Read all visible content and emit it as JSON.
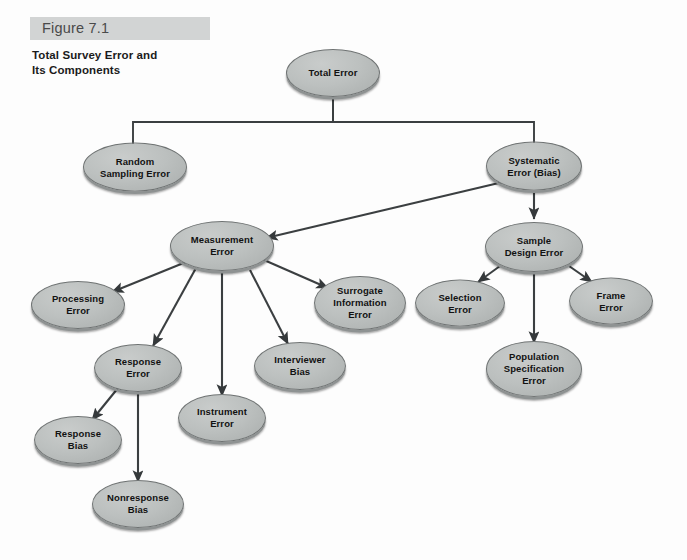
{
  "caption": {
    "figure_label": "Figure 7.1",
    "title": "Total Survey Error and\nIts Components",
    "title_line1": "Total Survey Error and",
    "title_line2": "Its Components"
  },
  "colors": {
    "page_background": "#fdfdfd",
    "band_background": "#d2d4d4",
    "node_fill": "#bcc0bf",
    "node_stroke": "#6f7373",
    "node_shadow": "#8e9292",
    "edge": "#3b3f41",
    "text": "#121212"
  },
  "chart_data": {
    "type": "diagram",
    "diagram_type": "hierarchy-tree",
    "title": "Total Survey Error and Its Components",
    "nodes": [
      {
        "id": "total-error",
        "label": "Total Error",
        "lines": [
          "Total Error"
        ],
        "x": 333,
        "y": 73,
        "w": 94,
        "h": 48
      },
      {
        "id": "random-sampling-error",
        "label": "Random Sampling Error",
        "lines": [
          "Random",
          "Sampling Error"
        ],
        "x": 135,
        "y": 167,
        "w": 104,
        "h": 49
      },
      {
        "id": "systematic-error-bias",
        "label": "Systematic Error (Bias)",
        "lines": [
          "Systematic",
          "Error (Bias)"
        ],
        "x": 534,
        "y": 166,
        "w": 96,
        "h": 49
      },
      {
        "id": "measurement-error",
        "label": "Measurement Error",
        "lines": [
          "Measurement",
          "Error"
        ],
        "x": 222,
        "y": 246,
        "w": 104,
        "h": 50
      },
      {
        "id": "sample-design-error",
        "label": "Sample Design Error",
        "lines": [
          "Sample",
          "Design Error"
        ],
        "x": 534,
        "y": 247,
        "w": 98,
        "h": 50
      },
      {
        "id": "processing-error",
        "label": "Processing Error",
        "lines": [
          "Processing",
          "Error"
        ],
        "x": 78,
        "y": 305,
        "w": 94,
        "h": 48
      },
      {
        "id": "surrogate-information-error",
        "label": "Surrogate Information Error",
        "lines": [
          "Surrogate",
          "Information",
          "Error"
        ],
        "x": 360,
        "y": 303,
        "w": 92,
        "h": 54
      },
      {
        "id": "selection-error",
        "label": "Selection Error",
        "lines": [
          "Selection",
          "Error"
        ],
        "x": 460,
        "y": 303,
        "w": 90,
        "h": 47
      },
      {
        "id": "frame-error",
        "label": "Frame Error",
        "lines": [
          "Frame",
          "Error"
        ],
        "x": 611,
        "y": 301,
        "w": 84,
        "h": 47
      },
      {
        "id": "response-error",
        "label": "Response Error",
        "lines": [
          "Response",
          "Error"
        ],
        "x": 138,
        "y": 368,
        "w": 88,
        "h": 48
      },
      {
        "id": "interviewer-bias",
        "label": "Interviewer Bias",
        "lines": [
          "Interviewer",
          "Bias"
        ],
        "x": 300,
        "y": 366,
        "w": 92,
        "h": 48
      },
      {
        "id": "population-specification-error",
        "label": "Population Specification Error",
        "lines": [
          "Population",
          "Specification",
          "Error"
        ],
        "x": 534,
        "y": 369,
        "w": 96,
        "h": 56
      },
      {
        "id": "instrument-error",
        "label": "Instrument Error",
        "lines": [
          "Instrument",
          "Error"
        ],
        "x": 222,
        "y": 418,
        "w": 88,
        "h": 48
      },
      {
        "id": "response-bias",
        "label": "Response Bias",
        "lines": [
          "Response",
          "Bias"
        ],
        "x": 78,
        "y": 440,
        "w": 88,
        "h": 48
      },
      {
        "id": "nonresponse-bias",
        "label": "Nonresponse Bias",
        "lines": [
          "Nonresponse",
          "Bias"
        ],
        "x": 138,
        "y": 504,
        "w": 92,
        "h": 48
      }
    ],
    "edges": [
      {
        "from": "total-error",
        "to": "random-sampling-error",
        "style": "elbow",
        "arrow": false
      },
      {
        "from": "total-error",
        "to": "systematic-error-bias",
        "style": "elbow",
        "arrow": false
      },
      {
        "from": "systematic-error-bias",
        "to": "measurement-error",
        "style": "straight",
        "arrow": true
      },
      {
        "from": "systematic-error-bias",
        "to": "sample-design-error",
        "style": "straight",
        "arrow": true
      },
      {
        "from": "measurement-error",
        "to": "processing-error",
        "style": "straight",
        "arrow": true
      },
      {
        "from": "measurement-error",
        "to": "surrogate-information-error",
        "style": "straight",
        "arrow": true
      },
      {
        "from": "measurement-error",
        "to": "response-error",
        "style": "straight",
        "arrow": true
      },
      {
        "from": "measurement-error",
        "to": "interviewer-bias",
        "style": "straight",
        "arrow": true
      },
      {
        "from": "measurement-error",
        "to": "instrument-error",
        "style": "straight",
        "arrow": true
      },
      {
        "from": "response-error",
        "to": "response-bias",
        "style": "straight",
        "arrow": true
      },
      {
        "from": "response-error",
        "to": "nonresponse-bias",
        "style": "straight",
        "arrow": true
      },
      {
        "from": "sample-design-error",
        "to": "selection-error",
        "style": "straight",
        "arrow": true
      },
      {
        "from": "sample-design-error",
        "to": "frame-error",
        "style": "straight",
        "arrow": true
      },
      {
        "from": "sample-design-error",
        "to": "population-specification-error",
        "style": "straight",
        "arrow": true
      }
    ],
    "edge_geometry": [
      {
        "name": "total-to-random",
        "points": "333,99 333,122 133,122 133,146",
        "arrow": false
      },
      {
        "name": "total-to-systematic",
        "points": "333,99 333,122 534,122 534,144",
        "arrow": false
      },
      {
        "name": "systematic-to-measurement",
        "points": "503,182 266,238",
        "arrow": true
      },
      {
        "name": "systematic-to-sample",
        "points": "534,191 534,219",
        "arrow": true
      },
      {
        "name": "measurement-to-processing",
        "points": "186,262 112,292",
        "arrow": true
      },
      {
        "name": "measurement-to-surrogate",
        "points": "264,260 328,288",
        "arrow": true
      },
      {
        "name": "measurement-to-response",
        "points": "196,268 153,346",
        "arrow": true
      },
      {
        "name": "measurement-to-interviewer",
        "points": "250,270 288,344",
        "arrow": true
      },
      {
        "name": "measurement-to-instrument",
        "points": "222,272 222,396",
        "arrow": true
      },
      {
        "name": "response-to-responsebias",
        "points": "118,388 92,420",
        "arrow": true
      },
      {
        "name": "response-to-nonresponse",
        "points": "138,392 138,482",
        "arrow": true
      },
      {
        "name": "sample-to-selection",
        "points": "500,266 478,282",
        "arrow": true
      },
      {
        "name": "sample-to-frame",
        "points": "569,266 592,282",
        "arrow": true
      },
      {
        "name": "sample-to-population",
        "points": "534,273 534,343",
        "arrow": true
      }
    ]
  }
}
